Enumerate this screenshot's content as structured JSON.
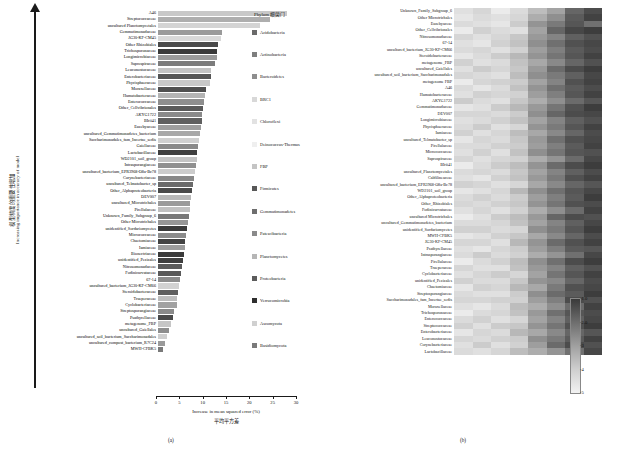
{
  "panel_a": {
    "panel_label": "(a)",
    "y_axis_label_cn": "模型精度的重要性增加",
    "y_axis_label_en": "Increasing importance in accuracy of model",
    "x_axis_label_en": "Increase in mean squared error (%)",
    "x_axis_label_cn": "平均平方差",
    "x_ticks": [
      "0",
      "5",
      "10",
      "15",
      "20",
      "25",
      "30"
    ],
    "x_min": 0,
    "x_max": 30,
    "bars": [
      {
        "label": "A46",
        "value": 28.4,
        "color": "#c8c8c8"
      },
      {
        "label": "Streptococcaceae",
        "value": 24.8,
        "color": "#aeaeae"
      },
      {
        "label": "uncultured Planctomycetales",
        "value": 22.6,
        "color": "#d4d4d4"
      },
      {
        "label": "Gemmatimonadaceae",
        "value": 14.1,
        "color": "#9a9a9a"
      },
      {
        "label": "JG30-KF-CM45",
        "value": 14.0,
        "color": "#d8d8d8"
      },
      {
        "label": "Other Rhizobiales",
        "value": 13.2,
        "color": "#4a4a4a"
      },
      {
        "label": "Trichosporonaceae",
        "value": 13.1,
        "color": "#3a3a3a"
      },
      {
        "label": "Longimicrobiaceae",
        "value": 13.0,
        "color": "#9a9a9a"
      },
      {
        "label": "Saprospiraceae",
        "value": 12.6,
        "color": "#7c7c7c"
      },
      {
        "label": "Leuconostocaceae",
        "value": 11.8,
        "color": "#c2c2c2"
      },
      {
        "label": "Enterobacteriaceae",
        "value": 11.6,
        "color": "#555555"
      },
      {
        "label": "Phycisphaeraceae",
        "value": 11.4,
        "color": "#c8c8c8"
      },
      {
        "label": "Moraxellaceae",
        "value": 10.6,
        "color": "#4f4f4f"
      },
      {
        "label": "Humatobacteraceae",
        "value": 10.4,
        "color": "#b4b4b4"
      },
      {
        "label": "Enterococcaceae",
        "value": 10.2,
        "color": "#8e8e8e"
      },
      {
        "label": "Other_Cellvibrionales",
        "value": 10.0,
        "color": "#5a5a5a"
      },
      {
        "label": "AKYG1722",
        "value": 9.8,
        "color": "#8a8a8a"
      },
      {
        "label": "BIrii41",
        "value": 9.6,
        "color": "#5f5f5f"
      },
      {
        "label": "Euzebyaceae",
        "value": 9.4,
        "color": "#9e9e9e"
      },
      {
        "label": "uncultured_Gemmatimonadetes_bacterium",
        "value": 9.2,
        "color": "#a8a8a8"
      },
      {
        "label": "Saccharimonadales_fam_Incertae_sedis",
        "value": 9.0,
        "color": "#d0d0d0"
      },
      {
        "label": "Gaiellaceae",
        "value": 8.8,
        "color": "#8a8a8a"
      },
      {
        "label": "Lactobacillaceae",
        "value": 8.6,
        "color": "#3f3f3f"
      },
      {
        "label": "WD2101_soil_group",
        "value": 8.5,
        "color": "#c4c4c4"
      },
      {
        "label": "Intrasporangiaceae",
        "value": 8.3,
        "color": "#909090"
      },
      {
        "label": "uncultured_bacterium_EPR3968-O8a-Bc78",
        "value": 8.1,
        "color": "#cccccc"
      },
      {
        "label": "Corynebacteriaceae",
        "value": 7.9,
        "color": "#888888"
      },
      {
        "label": "uncultured_Telmatobacter_sp",
        "value": 7.7,
        "color": "#6a6a6a"
      },
      {
        "label": "Other_Alphaproteobacteria",
        "value": 7.5,
        "color": "#4a4a4a"
      },
      {
        "label": "DEV007",
        "value": 7.3,
        "color": "#b8b8b8"
      },
      {
        "label": "uncultured_Microtrichales",
        "value": 7.1,
        "color": "#9a9a9a"
      },
      {
        "label": "Pirellulaceae",
        "value": 7.0,
        "color": "#c0c0c0"
      },
      {
        "label": "Unknown_Family_Subgroup_6",
        "value": 6.8,
        "color": "#787878"
      },
      {
        "label": "Other Microtrichales",
        "value": 6.6,
        "color": "#979797"
      },
      {
        "label": "unidentified_Sordariomycetes",
        "value": 6.4,
        "color": "#3c3c3c"
      },
      {
        "label": "Micrococcaceae",
        "value": 6.2,
        "color": "#8c8c8c"
      },
      {
        "label": "Chaetomiaceae",
        "value": 6.0,
        "color": "#434343"
      },
      {
        "label": "Iamiaceae",
        "value": 5.9,
        "color": "#9c9c9c"
      },
      {
        "label": "Bionectriaceae",
        "value": 5.7,
        "color": "#3a3a3a"
      },
      {
        "label": "unidentified_Pezizales",
        "value": 5.5,
        "color": "#3f3f3f"
      },
      {
        "label": "Nitrosomonadaceae",
        "value": 5.3,
        "color": "#5c5c5c"
      },
      {
        "label": "Fodinicurvataceae",
        "value": 5.1,
        "color": "#5a5a5a"
      },
      {
        "label": "67-14",
        "value": 4.9,
        "color": "#8c8c8c"
      },
      {
        "label": "uncultured_bacterium_JG30-KF-CM66",
        "value": 4.7,
        "color": "#d2d2d2"
      },
      {
        "label": "Steroidobacteraceae",
        "value": 4.5,
        "color": "#5e5e5e"
      },
      {
        "label": "Trueperaceae",
        "value": 4.3,
        "color": "#bdbdbd"
      },
      {
        "label": "Cyclobacteriaceae",
        "value": 4.1,
        "color": "#a2a2a2"
      },
      {
        "label": "Streptosporangiaceae",
        "value": 3.6,
        "color": "#8a8a8a"
      },
      {
        "label": "Psathyrellaceae",
        "value": 3.2,
        "color": "#4a4a4a"
      },
      {
        "label": "metagenome_FBP",
        "value": 2.8,
        "color": "#c6c6c6"
      },
      {
        "label": "uncultured_Gaiellales",
        "value": 2.4,
        "color": "#8e8e8e"
      },
      {
        "label": "uncultured_soil_bacterium_Saccharimonadales",
        "value": 2.0,
        "color": "#cfcfcf"
      },
      {
        "label": "uncultured_compost_bacterium_R7C24",
        "value": 1.6,
        "color": "#9a9a9a"
      },
      {
        "label": "MWH-CFBK5",
        "value": 1.2,
        "color": "#7a7a7a"
      }
    ]
  },
  "panel_b": {
    "panel_label": "(b)",
    "legend_title": "Phylum 细菌门",
    "legend": [
      {
        "label": "Acidobacteria",
        "color": "#6a6a6a"
      },
      {
        "label": "Actinobacteria",
        "color": "#7e7e7e"
      },
      {
        "label": "Bacteroidetes",
        "color": "#8e8e8e"
      },
      {
        "label": "BRC1",
        "color": "#d8d8d8"
      },
      {
        "label": "Chloroflexi",
        "color": "#e2e2e2"
      },
      {
        "label": "Deinococcus-Thermus",
        "color": "#efefef"
      },
      {
        "label": "FBP",
        "color": "#c4c4c4"
      },
      {
        "label": "Firmicutes",
        "color": "#585858"
      },
      {
        "label": "Gemmatimonadetes",
        "color": "#6e6e6e"
      },
      {
        "label": "Patescibacteria",
        "color": "#8a8a8a"
      },
      {
        "label": "Planctomycetes",
        "color": "#b6b6b6"
      },
      {
        "label": "Proteobacteria",
        "color": "#5c5c5c"
      },
      {
        "label": "Verrucomicrobia",
        "color": "#2e2e2e"
      },
      {
        "label": "Ascomycota",
        "color": "#d0d0d0"
      },
      {
        "label": "Basidiomycota",
        "color": "#7a7a7a"
      }
    ],
    "colorbar_ticks": [
      "-1.0",
      "-2.0",
      "-3",
      "-4",
      "-5"
    ],
    "rows": [
      {
        "label": "Unknown_Family_Subgroup_6",
        "values": [
          -4.6,
          -4.4,
          -4.8,
          -4.5,
          -3.9,
          -3.4,
          -2.2,
          -1.7
        ]
      },
      {
        "label": "Other Microtrichales",
        "values": [
          -4.7,
          -4.5,
          -4.6,
          -4.4,
          -3.6,
          -3.0,
          -2.0,
          -1.5
        ]
      },
      {
        "label": "Euzebyaceae",
        "values": [
          -4.5,
          -4.6,
          -4.7,
          -4.2,
          -3.1,
          -2.6,
          -1.9,
          -2.4
        ]
      },
      {
        "label": "Other_Cellvibrionales",
        "values": [
          -4.8,
          -4.3,
          -4.5,
          -4.6,
          -3.4,
          -2.2,
          -1.6,
          -1.4
        ]
      },
      {
        "label": "Nitrosomonadaceae",
        "values": [
          -4.4,
          -4.6,
          -4.4,
          -4.1,
          -3.2,
          -2.8,
          -2.1,
          -1.8
        ]
      },
      {
        "label": "67-14",
        "values": [
          -4.6,
          -4.7,
          -4.3,
          -4.0,
          -3.0,
          -2.4,
          -1.8,
          -1.6
        ]
      },
      {
        "label": "uncultured_bacterium_JG30-KF-CM66",
        "values": [
          -4.5,
          -4.4,
          -4.6,
          -4.3,
          -3.3,
          -2.7,
          -2.0,
          -1.7
        ]
      },
      {
        "label": "Steroidobacteraceae",
        "values": [
          -4.7,
          -4.5,
          -4.2,
          -3.8,
          -3.1,
          -2.5,
          -1.9,
          -1.5
        ]
      },
      {
        "label": "metagenome_FBP",
        "values": [
          -4.3,
          -4.6,
          -4.5,
          -4.0,
          -3.5,
          -2.9,
          -2.2,
          -1.8
        ]
      },
      {
        "label": "uncultured_Gaiellales",
        "values": [
          -4.6,
          -4.2,
          -4.4,
          -4.1,
          -3.2,
          -2.3,
          -1.7,
          -1.4
        ]
      },
      {
        "label": "uncultured_soil_bacterium_Saccharimonadales",
        "values": [
          -4.4,
          -4.5,
          -4.6,
          -3.9,
          -3.0,
          -2.6,
          -2.1,
          -1.6
        ]
      },
      {
        "label": "metagenome FBP",
        "values": [
          -4.8,
          -4.4,
          -4.3,
          -4.2,
          -3.4,
          -2.8,
          -1.8,
          -1.5
        ]
      },
      {
        "label": "A46",
        "values": [
          -4.5,
          -4.7,
          -4.5,
          -4.0,
          -3.1,
          -2.4,
          -2.0,
          -1.7
        ]
      },
      {
        "label": "Humatobacteraceae",
        "values": [
          -4.6,
          -4.3,
          -4.4,
          -4.3,
          -3.3,
          -2.7,
          -1.9,
          -1.5
        ]
      },
      {
        "label": "AKYG1722",
        "values": [
          -4.2,
          -4.5,
          -4.6,
          -4.1,
          -3.6,
          -3.0,
          -2.3,
          -1.9
        ]
      },
      {
        "label": "Gemmatimonadaceae",
        "values": [
          -4.7,
          -4.6,
          -4.2,
          -3.8,
          -3.2,
          -2.5,
          -1.8,
          -1.4
        ]
      },
      {
        "label": "DEV007",
        "values": [
          -4.4,
          -4.4,
          -4.5,
          -4.2,
          -3.0,
          -2.2,
          -1.7,
          -1.6
        ]
      },
      {
        "label": "Longimicrobiaceae",
        "values": [
          -4.6,
          -4.5,
          -4.3,
          -4.0,
          -3.4,
          -2.8,
          -2.1,
          -1.8
        ]
      },
      {
        "label": "Phycisphaeraceae",
        "values": [
          -4.5,
          -4.2,
          -4.6,
          -4.4,
          -3.1,
          -2.6,
          -1.9,
          -1.5
        ]
      },
      {
        "label": "Iamiaceae",
        "values": [
          -4.3,
          -4.6,
          -4.4,
          -3.9,
          -3.5,
          -2.9,
          -2.2,
          -1.7
        ]
      },
      {
        "label": "uncultured_Telmatobacter_sp",
        "values": [
          -4.7,
          -4.4,
          -4.5,
          -4.1,
          -3.2,
          -2.4,
          -1.8,
          -1.6
        ]
      },
      {
        "label": "Pirellulaceae",
        "values": [
          -4.5,
          -4.5,
          -4.3,
          -4.2,
          -3.3,
          -2.7,
          -2.0,
          -1.5
        ]
      },
      {
        "label": "Micrococcaceae",
        "values": [
          -4.6,
          -4.3,
          -4.6,
          -4.0,
          -3.0,
          -2.5,
          -1.9,
          -1.8
        ]
      },
      {
        "label": "Saprospiraceae",
        "values": [
          -4.4,
          -4.6,
          -4.4,
          -4.3,
          -3.6,
          -3.1,
          -2.3,
          -1.6
        ]
      },
      {
        "label": "BIrii41",
        "values": [
          -4.8,
          -4.5,
          -4.2,
          -3.9,
          -3.1,
          -2.3,
          -1.7,
          -1.4
        ]
      },
      {
        "label": "uncultured_Planctomycetales",
        "values": [
          -4.5,
          -4.4,
          -4.5,
          -4.1,
          -3.4,
          -2.8,
          -2.1,
          -1.7
        ]
      },
      {
        "label": "Caldilineaceae",
        "values": [
          -4.6,
          -4.7,
          -4.3,
          -4.0,
          -3.2,
          -2.6,
          -1.8,
          -1.5
        ]
      },
      {
        "label": "uncultured_bacterium_EPR3968-O8a-Bc78",
        "values": [
          -4.3,
          -4.4,
          -4.6,
          -4.4,
          -3.5,
          -2.9,
          -2.2,
          -1.9
        ]
      },
      {
        "label": "WD2101_soil_group",
        "values": [
          -4.7,
          -4.6,
          -4.4,
          -3.8,
          -3.0,
          -2.4,
          -1.9,
          -1.6
        ]
      },
      {
        "label": "Other_Alphaproteobacteria",
        "values": [
          -4.5,
          -4.3,
          -4.5,
          -4.2,
          -3.3,
          -2.7,
          -2.0,
          -1.4
        ]
      },
      {
        "label": "Other_Rhizobiales",
        "values": [
          -4.4,
          -4.5,
          -4.3,
          -4.1,
          -3.1,
          -2.5,
          -1.8,
          -1.7
        ]
      },
      {
        "label": "Fodinicurvataceae",
        "values": [
          -4.6,
          -4.4,
          -4.6,
          -4.3,
          -3.6,
          -3.0,
          -2.3,
          -1.5
        ]
      },
      {
        "label": "uncultured Microtrichales",
        "values": [
          -4.8,
          -4.6,
          -4.2,
          -3.9,
          -3.2,
          -2.2,
          -1.7,
          -1.8
        ]
      },
      {
        "label": "uncultured_Gemmatimonadetes_bacterium",
        "values": [
          -4.5,
          -4.5,
          -4.4,
          -4.0,
          -3.4,
          -2.8,
          -2.1,
          -1.6
        ]
      },
      {
        "label": "unidentified_Sordariomycetes",
        "values": [
          -4.3,
          -4.3,
          -4.5,
          -4.4,
          -3.0,
          -2.6,
          -1.9,
          -1.4
        ]
      },
      {
        "label": "MWH-CFBK5",
        "values": [
          -4.7,
          -4.6,
          -4.3,
          -4.1,
          -3.5,
          -2.9,
          -2.2,
          -1.7
        ]
      },
      {
        "label": "JG30-KF-CM45",
        "values": [
          -4.4,
          -4.4,
          -4.6,
          -3.8,
          -3.1,
          -2.3,
          -1.8,
          -1.5
        ]
      },
      {
        "label": "Psathyrellaceae",
        "values": [
          -4.6,
          -4.7,
          -4.4,
          -4.2,
          -3.3,
          -2.7,
          -2.0,
          -1.9
        ]
      },
      {
        "label": "Intrasporangiaceae",
        "values": [
          -4.5,
          -4.2,
          -4.5,
          -4.3,
          -3.6,
          -3.1,
          -2.4,
          -1.6
        ]
      },
      {
        "label": "Pirellulaceae",
        "values": [
          -4.8,
          -4.5,
          -4.3,
          -3.9,
          -3.0,
          -2.4,
          -1.7,
          -1.4
        ]
      },
      {
        "label": "Trueperaceae",
        "values": [
          -4.4,
          -4.6,
          -4.6,
          -4.0,
          -3.2,
          -2.8,
          -2.1,
          -1.8
        ]
      },
      {
        "label": "Cyclobacteriaceae",
        "values": [
          -4.6,
          -4.4,
          -4.2,
          -4.4,
          -3.4,
          -2.5,
          -1.9,
          -1.5
        ]
      },
      {
        "label": "unidentified_Pezizales",
        "values": [
          -4.3,
          -4.5,
          -4.5,
          -4.1,
          -3.1,
          -2.9,
          -2.2,
          -1.7
        ]
      },
      {
        "label": "Chaetomiaceae",
        "values": [
          -4.7,
          -4.3,
          -4.4,
          -3.8,
          -3.5,
          -2.6,
          -1.8,
          -1.6
        ]
      },
      {
        "label": "Streptosporangiaceae",
        "values": [
          -4.5,
          -4.6,
          -4.6,
          -4.2,
          -3.0,
          -2.3,
          -2.0,
          -1.4
        ]
      },
      {
        "label": "Saccharimonadales_fam_Incertae_sedis",
        "values": [
          -4.4,
          -4.4,
          -4.3,
          -4.3,
          -3.3,
          -2.7,
          -1.7,
          -1.8
        ]
      },
      {
        "label": "Moraxellaceae",
        "values": [
          -4.6,
          -4.7,
          -4.5,
          -3.9,
          -3.6,
          -3.0,
          -2.3,
          -1.5
        ]
      },
      {
        "label": "Trichosporonaceae",
        "values": [
          -4.8,
          -4.5,
          -4.4,
          -4.0,
          -3.2,
          -2.4,
          -1.9,
          -1.7
        ]
      },
      {
        "label": "Enterococcaceae",
        "values": [
          -4.5,
          -4.3,
          -4.6,
          -4.4,
          -3.4,
          -2.8,
          -2.1,
          -1.6
        ]
      },
      {
        "label": "Streptococcaceae",
        "values": [
          -4.3,
          -4.6,
          -4.2,
          -4.1,
          -3.1,
          -2.5,
          -1.8,
          -1.4
        ]
      },
      {
        "label": "Enterobacteriaceae",
        "values": [
          -4.7,
          -4.4,
          -4.5,
          -3.8,
          -3.5,
          -2.9,
          -2.2,
          -1.9
        ]
      },
      {
        "label": "Leuconostocaceae",
        "values": [
          -4.4,
          -4.5,
          -4.3,
          -4.2,
          -3.0,
          -2.6,
          -2.0,
          -1.5
        ]
      },
      {
        "label": "Corynebacteriaceae",
        "values": [
          -4.6,
          -4.2,
          -4.6,
          -4.3,
          -3.3,
          -2.3,
          -1.7,
          -1.8
        ]
      },
      {
        "label": "Lactobacillaceae",
        "values": [
          -4.5,
          -4.6,
          -4.4,
          -3.9,
          -3.6,
          -3.1,
          -2.4,
          -1.6
        ]
      }
    ]
  }
}
